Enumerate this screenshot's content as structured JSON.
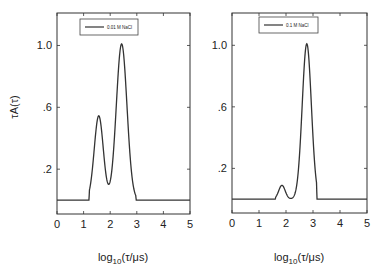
{
  "chart_data": [
    {
      "type": "line",
      "title": "",
      "legend": "0.01 M NaCl",
      "legend_position": "top-center",
      "xlabel": "log10(τ/μs)",
      "ylabel": "τA(τ)",
      "xlim": [
        0,
        5
      ],
      "ylim": [
        -0.09,
        1.21
      ],
      "xticks": [
        "0",
        "1",
        "2",
        "3",
        "4",
        "5"
      ],
      "yticks": [
        ".2",
        ".6",
        "1.0"
      ],
      "grid": false,
      "series": [
        {
          "name": "0.01 M NaCl",
          "peaks": [
            {
              "center": 1.57,
              "height": 0.545,
              "width": 0.17
            },
            {
              "center": 2.43,
              "height": 1.01,
              "width": 0.2
            }
          ],
          "baseline": 0.0,
          "support": [
            1.2,
            2.98
          ],
          "x": [
            0,
            1.2,
            1.3,
            1.4,
            1.5,
            1.57,
            1.65,
            1.75,
            1.85,
            1.95,
            2.05,
            2.15,
            2.25,
            2.35,
            2.43,
            2.5,
            2.6,
            2.7,
            2.8,
            2.9,
            2.98,
            5
          ],
          "y": [
            0,
            0,
            0.07,
            0.26,
            0.48,
            0.545,
            0.48,
            0.28,
            0.09,
            0.005,
            0.08,
            0.3,
            0.65,
            0.93,
            1.01,
            0.95,
            0.72,
            0.41,
            0.17,
            0.04,
            0,
            0
          ]
        }
      ]
    },
    {
      "type": "line",
      "title": "",
      "legend": "0.1 M NaCl",
      "legend_position": "top-center",
      "xlabel": "log10(τ/μs)",
      "ylabel": "",
      "xlim": [
        0,
        5
      ],
      "ylim": [
        -0.09,
        1.21
      ],
      "xticks": [
        "0",
        "1",
        "2",
        "3",
        "4",
        "5"
      ],
      "yticks": [
        ".2",
        ".6",
        "1.0"
      ],
      "grid": false,
      "series": [
        {
          "name": "0.1 M NaCl",
          "peaks": [
            {
              "center": 1.85,
              "height": 0.09,
              "width": 0.12
            },
            {
              "center": 2.77,
              "height": 1.01,
              "width": 0.17
            }
          ],
          "baseline": 0.0,
          "support": [
            1.6,
            3.15
          ],
          "x": [
            0,
            1.6,
            1.7,
            1.78,
            1.85,
            1.92,
            2.0,
            2.1,
            2.3,
            2.4,
            2.5,
            2.6,
            2.7,
            2.77,
            2.85,
            2.95,
            3.05,
            3.15,
            5
          ],
          "y": [
            0,
            0,
            0.03,
            0.075,
            0.09,
            0.075,
            0.03,
            0,
            -0.005,
            0.06,
            0.3,
            0.65,
            0.94,
            1.01,
            0.92,
            0.55,
            0.17,
            0,
            0
          ]
        }
      ]
    }
  ]
}
